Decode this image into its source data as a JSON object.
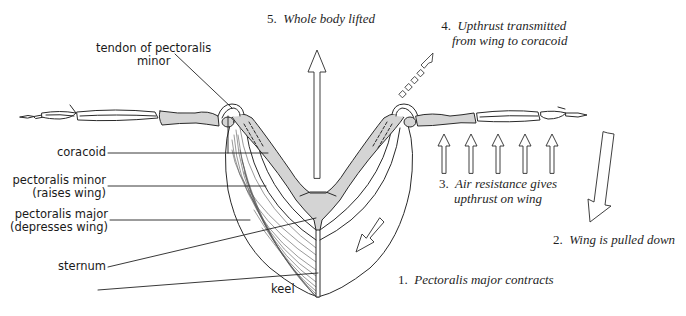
{
  "diagram": {
    "labels": {
      "tendon": [
        "tendon of pectoralis",
        "minor"
      ],
      "coracoid": "coracoid",
      "pec_minor": [
        "pectoralis minor",
        "(raises wing)"
      ],
      "pec_major": [
        "pectoralis major",
        "(depresses wing)"
      ],
      "sternum": "sternum",
      "keel": "keel"
    },
    "steps": {
      "s1": {
        "num": "1.",
        "text": "Pectoralis major contracts"
      },
      "s2": {
        "num": "2.",
        "text": "Wing is pulled down"
      },
      "s3": {
        "num": "3.",
        "text": "Air resistance gives",
        "text2": "upthrust on wing"
      },
      "s4": {
        "num": "4.",
        "text": "Upthrust transmitted",
        "text2": "from wing to coracoid"
      },
      "s5": {
        "num": "5.",
        "text": "Whole body lifted"
      }
    },
    "colors": {
      "ink": "#2a2a2a",
      "bone_fill": "#d4d4d4",
      "background": "#ffffff"
    }
  }
}
